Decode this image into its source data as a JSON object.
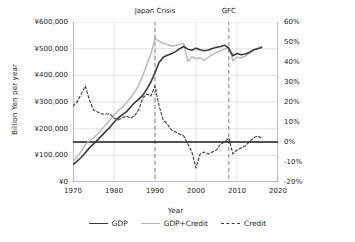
{
  "chart_data": {
    "type": "line",
    "title": "",
    "xlabel": "Year",
    "ylabel": "Billion Yen per year",
    "ylabel_secondary": "Percent of GDP per year",
    "xlim": [
      1970,
      2020
    ],
    "ylim": [
      0,
      600000
    ],
    "ylim_secondary": [
      -20,
      60
    ],
    "xticks": [
      "1970",
      "1980",
      "1990",
      "2000",
      "2010",
      "2020"
    ],
    "yticks": [
      "¥0",
      "¥100,000",
      "¥200,000",
      "¥300,000",
      "¥400,000",
      "¥500,000",
      "¥600,000"
    ],
    "yticks_secondary": [
      "-20%",
      "-10%",
      "0%",
      "10%",
      "20%",
      "30%",
      "40%",
      "50%",
      "60%"
    ],
    "grid": true,
    "zero_reference_line": {
      "left_value": 150000,
      "right_value": 0,
      "color": "#1a1a1a"
    },
    "legend_position": "bottom",
    "colors": {
      "gdp": "#3b3b3b",
      "gdp_credit": "#b6b6b6",
      "credit": "#3b3b3b",
      "grid": "#d8d8d8",
      "event_line": "#8c8c8c"
    },
    "annotations": [
      {
        "label": "Japan Crisis",
        "x": 1990,
        "style": "dashed-vertical"
      },
      {
        "label": "GFC",
        "x": 2008,
        "style": "dashed-vertical"
      }
    ],
    "series": [
      {
        "name": "GDP",
        "axis": "left",
        "unit": "Billion Yen per year",
        "style": "solid",
        "x": [
          1970,
          1971,
          1972,
          1973,
          1974,
          1975,
          1976,
          1977,
          1978,
          1979,
          1980,
          1981,
          1982,
          1983,
          1984,
          1985,
          1986,
          1987,
          1988,
          1989,
          1990,
          1991,
          1992,
          1993,
          1994,
          1995,
          1996,
          1997,
          1998,
          1999,
          2000,
          2001,
          2002,
          2003,
          2004,
          2005,
          2006,
          2007,
          2008,
          2009,
          2010,
          2011,
          2012,
          2013,
          2014,
          2015,
          2016
        ],
        "values": [
          65000,
          78000,
          92000,
          110000,
          128000,
          143000,
          158000,
          174000,
          190000,
          205000,
          224000,
          240000,
          252000,
          263000,
          280000,
          297000,
          310000,
          325000,
          348000,
          375000,
          410000,
          448000,
          468000,
          475000,
          481000,
          489000,
          500000,
          508000,
          498000,
          494000,
          502000,
          496000,
          492000,
          495000,
          501000,
          505000,
          508000,
          513000,
          501000,
          473000,
          482000,
          477000,
          480000,
          486000,
          495000,
          500000,
          504000
        ]
      },
      {
        "name": "GDP+Credit",
        "axis": "left",
        "unit": "Billion Yen per year",
        "style": "solid",
        "x": [
          1970,
          1971,
          1972,
          1973,
          1974,
          1975,
          1976,
          1977,
          1978,
          1979,
          1980,
          1981,
          1982,
          1983,
          1984,
          1985,
          1986,
          1987,
          1988,
          1989,
          1990,
          1991,
          1992,
          1993,
          1994,
          1995,
          1996,
          1997,
          1998,
          1999,
          2000,
          2001,
          2002,
          2003,
          2004,
          2005,
          2006,
          2007,
          2008,
          2009,
          2010,
          2011,
          2012,
          2013,
          2014,
          2015,
          2016
        ],
        "values": [
          77000,
          95000,
          115000,
          140000,
          155000,
          165000,
          180000,
          197000,
          214000,
          232000,
          250000,
          266000,
          281000,
          297000,
          315000,
          336000,
          362000,
          398000,
          440000,
          480000,
          538000,
          528000,
          520000,
          516000,
          510000,
          512000,
          516000,
          520000,
          452000,
          470000,
          462000,
          466000,
          456000,
          468000,
          478000,
          486000,
          492000,
          498000,
          506000,
          455000,
          468000,
          466000,
          472000,
          483000,
          494000,
          502000,
          508000
        ]
      },
      {
        "name": "Credit",
        "axis": "right",
        "unit": "Percent of GDP per year",
        "style": "dashed",
        "x": [
          1970,
          1971,
          1972,
          1973,
          1974,
          1975,
          1976,
          1977,
          1978,
          1979,
          1980,
          1981,
          1982,
          1983,
          1984,
          1985,
          1986,
          1987,
          1988,
          1989,
          1990,
          1991,
          1992,
          1993,
          1994,
          1995,
          1996,
          1997,
          1998,
          1999,
          2000,
          2001,
          2002,
          2003,
          2004,
          2005,
          2006,
          2007,
          2008,
          2009,
          2010,
          2011,
          2012,
          2013,
          2014,
          2015,
          2016
        ],
        "values": [
          18,
          20,
          24,
          28,
          21,
          16,
          15,
          14,
          14,
          14,
          12,
          11,
          12,
          13,
          12,
          13,
          16,
          22,
          24,
          23,
          28,
          18,
          11,
          9,
          6,
          5,
          4,
          3,
          -1,
          -5,
          -13,
          -6,
          -5,
          -6,
          -5,
          -4,
          -1,
          0,
          2,
          -6,
          -4,
          -3,
          -2,
          0,
          2,
          3,
          2
        ]
      }
    ]
  },
  "axes": {
    "left_title": "Billion Yen per year",
    "right_title": "Percent of GDP per year",
    "bottom_title": "Year"
  },
  "legend": {
    "items": [
      {
        "label": "GDP",
        "icon": "solid-line-swatch"
      },
      {
        "label": "GDP+Credit",
        "icon": "solid-line-swatch"
      },
      {
        "label": "Credit",
        "icon": "dashed-line-swatch"
      }
    ]
  },
  "events": [
    {
      "label": "Japan Crisis"
    },
    {
      "label": "GFC"
    }
  ]
}
